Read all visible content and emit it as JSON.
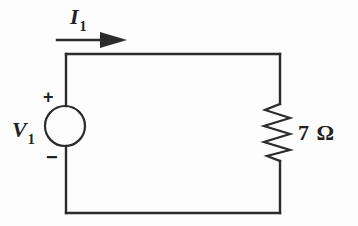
{
  "diagram": {
    "type": "circuit-diagram",
    "current_label": {
      "symbol": "I",
      "subscript": "1"
    },
    "source_label": {
      "symbol": "V",
      "subscript": "1"
    },
    "source_polarity": {
      "plus": "+",
      "minus": "−"
    },
    "resistor_label": "7 Ω",
    "components": [
      {
        "name": "voltage-source",
        "label": "V1",
        "position": "left"
      },
      {
        "name": "resistor",
        "label": "7 Ω",
        "position": "right"
      },
      {
        "name": "current-arrow",
        "label": "I1",
        "direction": "right",
        "position": "top"
      }
    ],
    "colors": {
      "line": "#2b2b2b",
      "text": "#222222",
      "background": "#fdfdfd"
    }
  }
}
